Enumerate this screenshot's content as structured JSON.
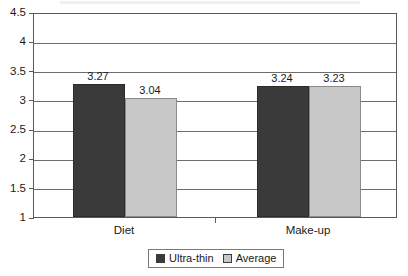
{
  "chart_data": {
    "type": "bar",
    "title": "",
    "subtitle": "",
    "xlabel": "",
    "ylabel": "",
    "categories": [
      "Diet",
      "Make-up"
    ],
    "series": [
      {
        "name": "Ultra-thin",
        "color": "#3a3a3a",
        "values": [
          3.27,
          3.04
        ]
      },
      {
        "name": "Average",
        "color": "#c8c8c8",
        "values": [
          3.24,
          3.23
        ]
      }
    ],
    "series_by_group": [
      {
        "category": "Diet",
        "bars": [
          {
            "series": "Ultra-thin",
            "value": 3.27,
            "label": "3.27"
          },
          {
            "series": "Average",
            "value": 3.04,
            "label": "3.04"
          }
        ]
      },
      {
        "category": "Make-up",
        "bars": [
          {
            "series": "Ultra-thin",
            "value": 3.24,
            "label": "3.24"
          },
          {
            "series": "Average",
            "value": 3.23,
            "label": "3.23"
          }
        ]
      }
    ],
    "ylim": [
      1,
      4.5
    ],
    "ytick_values": [
      4.5,
      4,
      3.5,
      3,
      2.5,
      2,
      1.5,
      1
    ],
    "ytick_labels": [
      "4.5",
      "4",
      "3.5",
      "3",
      "2.5",
      "2",
      "1.5",
      "1"
    ],
    "grid": true,
    "grid_axis": "y",
    "legend_position": "bottom-center",
    "legend_entries": [
      "Ultra-thin",
      "Average"
    ],
    "bar_value_labels": [
      "3.27",
      "3.04",
      "3.24",
      "3.23"
    ]
  },
  "axes": {
    "y": {
      "ticks": [
        {
          "label": "4.5",
          "value": 4.5
        },
        {
          "label": "4",
          "value": 4
        },
        {
          "label": "3.5",
          "value": 3.5
        },
        {
          "label": "3",
          "value": 3
        },
        {
          "label": "2.5",
          "value": 2.5
        },
        {
          "label": "2",
          "value": 2
        },
        {
          "label": "1.5",
          "value": 1.5
        },
        {
          "label": "1",
          "value": 1
        }
      ]
    },
    "x": {
      "ticks": [
        {
          "label": "Diet"
        },
        {
          "label": "Make-up"
        }
      ]
    }
  },
  "legend": {
    "items": [
      {
        "label": "Ultra-thin",
        "color": "#3a3a3a"
      },
      {
        "label": "Average",
        "color": "#c8c8c8"
      }
    ]
  },
  "colors": {
    "ultra_thin": "#3a3a3a",
    "average": "#c8c8c8",
    "gridline": "#6d6d6d",
    "frame": "#5a5a5a",
    "background": "#ffffff",
    "text": "#1a1a1a"
  }
}
